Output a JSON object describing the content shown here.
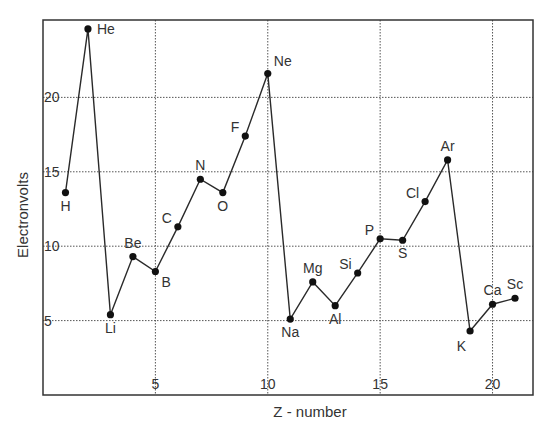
{
  "chart_data": {
    "type": "line",
    "title": "",
    "xlabel": "Z - number",
    "ylabel": "Electronvolts",
    "xlim": [
      0,
      21.8
    ],
    "ylim": [
      0,
      25.2
    ],
    "xticks": [
      5,
      10,
      15,
      20
    ],
    "yticks": [
      5,
      10,
      15,
      20
    ],
    "grid": true,
    "legend": null,
    "series": [
      {
        "name": "First ionization energy",
        "points": [
          {
            "z": 1,
            "label": "H",
            "value": 13.6,
            "label_pos": "below"
          },
          {
            "z": 2,
            "label": "He",
            "value": 24.6,
            "label_pos": "right"
          },
          {
            "z": 3,
            "label": "Li",
            "value": 5.4,
            "label_pos": "below"
          },
          {
            "z": 4,
            "label": "Be",
            "value": 9.3,
            "label_pos": "above"
          },
          {
            "z": 5,
            "label": "B",
            "value": 8.3,
            "label_pos": "below-right"
          },
          {
            "z": 6,
            "label": "C",
            "value": 11.3,
            "label_pos": "above-left"
          },
          {
            "z": 7,
            "label": "N",
            "value": 14.5,
            "label_pos": "above"
          },
          {
            "z": 8,
            "label": "O",
            "value": 13.6,
            "label_pos": "below"
          },
          {
            "z": 9,
            "label": "F",
            "value": 17.4,
            "label_pos": "above-left"
          },
          {
            "z": 10,
            "label": "Ne",
            "value": 21.6,
            "label_pos": "above-right"
          },
          {
            "z": 11,
            "label": "Na",
            "value": 5.1,
            "label_pos": "below"
          },
          {
            "z": 12,
            "label": "Mg",
            "value": 7.6,
            "label_pos": "above"
          },
          {
            "z": 13,
            "label": "Al",
            "value": 6.0,
            "label_pos": "below"
          },
          {
            "z": 14,
            "label": "Si",
            "value": 8.2,
            "label_pos": "above-left"
          },
          {
            "z": 15,
            "label": "P",
            "value": 10.5,
            "label_pos": "above-left"
          },
          {
            "z": 16,
            "label": "S",
            "value": 10.4,
            "label_pos": "below"
          },
          {
            "z": 17,
            "label": "Cl",
            "value": 13.0,
            "label_pos": "above-left"
          },
          {
            "z": 18,
            "label": "Ar",
            "value": 15.8,
            "label_pos": "above"
          },
          {
            "z": 19,
            "label": "K",
            "value": 4.3,
            "label_pos": "below-left"
          },
          {
            "z": 20,
            "label": "Ca",
            "value": 6.1,
            "label_pos": "above"
          },
          {
            "z": 21,
            "label": "Sc",
            "value": 6.5,
            "label_pos": "above"
          }
        ]
      }
    ]
  },
  "colors": {
    "line": "#2a2a2a",
    "marker": "#111111",
    "grid": "#555555",
    "frame": "#333333",
    "text": "#333333"
  }
}
